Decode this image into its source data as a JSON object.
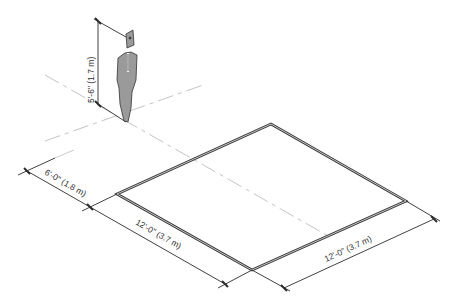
{
  "diagram": {
    "type": "isometric clearance diagram",
    "colors": {
      "line": "#2b2b2b",
      "square_edge": "#3a3a3a",
      "dash_line": "#c4c4c4",
      "figure_fill": "#9a9a9a",
      "figure_stroke": "#333333",
      "background": "#ffffff"
    },
    "dimensions": {
      "height": "5'-6\" (1.7 m)",
      "offset": "6'-0\" (1.8 m)",
      "width_left": "12'-0\" (3.7 m)",
      "width_right": "12'-0\" (3.7 m)"
    },
    "figure": {
      "label": "standing person"
    },
    "square": {
      "label": "clear floor area"
    }
  }
}
